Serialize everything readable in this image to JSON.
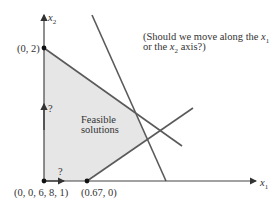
{
  "question": {
    "line1_prefix": "(Should we move along the ",
    "line1_var": "x",
    "line1_sub": "1",
    "line2_prefix": "or the ",
    "line2_var": "x",
    "line2_sub": "2",
    "line2_suffix": " axis?)"
  },
  "axes": {
    "x_axis": {
      "var": "x",
      "sub": "1"
    },
    "y_axis": {
      "var": "x",
      "sub": "2"
    }
  },
  "region": {
    "label_line1": "Feasible",
    "label_line2": "solutions",
    "fill": "#e6e6e6"
  },
  "points": {
    "top_vertex": "(0, 2)",
    "origin": "(0, 0, 6, 8, 1)",
    "right_vertex": "(0.67, 0)"
  },
  "direction_markers": {
    "up": "?",
    "right": "?"
  },
  "colors": {
    "line": "#5a5a5a",
    "axis": "#444444",
    "text": "#333333"
  }
}
